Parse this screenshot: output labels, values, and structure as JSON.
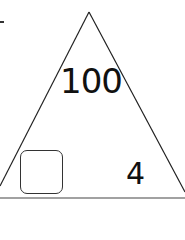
{
  "fact_triangle": {
    "top_value": "100",
    "bottom_left_value": "",
    "bottom_right_value": "4",
    "stroke_color": "#222222"
  }
}
